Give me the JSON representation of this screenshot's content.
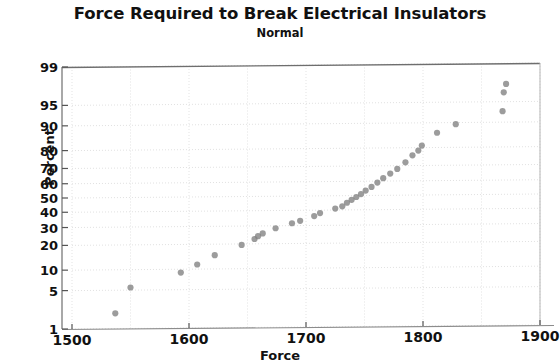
{
  "chart_data": {
    "type": "scatter",
    "title": "Force Required to Break Electrical Insulators",
    "subtitle": "Normal",
    "xlabel": "Force",
    "ylabel": "Percent",
    "xlim": [
      1500,
      1900
    ],
    "ylim": [
      1,
      99
    ],
    "yscale": "normal-probability",
    "grid": true,
    "legend": "none",
    "marker": {
      "shape": "circle",
      "color": "#808080",
      "size": 5
    },
    "xticks": [
      1500,
      1600,
      1700,
      1800,
      1900
    ],
    "yticks": [
      1,
      5,
      10,
      20,
      30,
      40,
      50,
      60,
      70,
      80,
      90,
      95,
      99
    ],
    "xticklabels": [
      "1500",
      "1600",
      "1700",
      "1800",
      "1900"
    ],
    "yticklabels": [
      "1",
      "5",
      "10",
      "20",
      "30",
      "40",
      "50",
      "60",
      "70",
      "80",
      "90",
      "95",
      "99"
    ],
    "n_points": 35,
    "x": [
      1537,
      1550,
      1593,
      1607,
      1622,
      1645,
      1656,
      1659,
      1663,
      1674,
      1688,
      1695,
      1707,
      1712,
      1725,
      1731,
      1735,
      1739,
      1743,
      1747,
      1751,
      1756,
      1761,
      1766,
      1772,
      1778,
      1785,
      1791,
      1796,
      1799,
      1812,
      1828,
      1868,
      1869,
      1871
    ],
    "y": [
      2.0,
      5.5,
      9.0,
      11.5,
      15.0,
      19.5,
      22.5,
      24.0,
      25.5,
      28.5,
      31.5,
      33.0,
      36.0,
      38.0,
      41.0,
      42.5,
      45.0,
      47.0,
      49.0,
      51.0,
      53.5,
      56.0,
      59.0,
      62.0,
      65.0,
      68.0,
      72.0,
      76.0,
      78.5,
      81.0,
      86.5,
      89.5,
      93.0,
      96.5,
      97.5
    ]
  },
  "axis": {
    "title": "Force Required to Break Electrical Insulators",
    "subtitle": "Normal",
    "xlabel": "Force",
    "ylabel": "Percent"
  }
}
